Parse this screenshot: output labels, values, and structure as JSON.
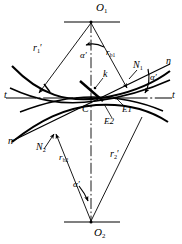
{
  "figure": {
    "type": "engineering-diagram",
    "background_color": "#ffffff",
    "line_color": "#000000",
    "width": 182,
    "height": 244
  },
  "labels": {
    "center_top": "O",
    "center_top_sub": "1",
    "center_bottom": "O",
    "center_bottom_sub": "2",
    "radius_pitch_top": "r",
    "radius_pitch_top_sub": "1",
    "radius_pitch_top_prime": "′",
    "radius_pitch_bottom": "r",
    "radius_pitch_bottom_sub": "2",
    "radius_pitch_bottom_prime": "′",
    "radius_base_top": "r",
    "radius_base_top_sub": "b1",
    "radius_base_bottom": "r",
    "radius_base_bottom_sub": "b2",
    "normal_top": "N",
    "normal_top_sub": "1",
    "normal_bottom": "N",
    "normal_bottom_sub": "2",
    "normal_line_right": "n",
    "normal_line_left": "n",
    "tangent_left": "t",
    "tangent_right": "t",
    "pressure_angle_top": "α′",
    "pressure_angle_right": "α′",
    "pressure_angle_bottom": "α′",
    "contact_point": "k",
    "pitch_point": "C",
    "engage_point_1": "E1",
    "engage_point_2": "E2"
  }
}
